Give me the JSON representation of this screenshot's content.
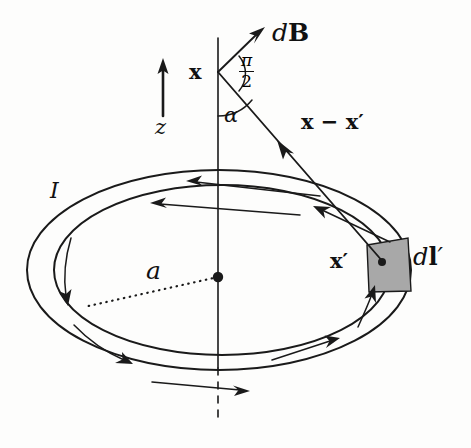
{
  "figure": {
    "background_color": "#fdfdfc",
    "ink_color": "#1a1a1a",
    "element_fill_color": "#a8a8a8"
  },
  "labels": {
    "field_element": "dB",
    "field_element_d": "d",
    "field_element_B": "B",
    "field_point": "x",
    "angle_alpha": "α",
    "angle_right_numerator": "π",
    "angle_right_denominator": "2",
    "separation_vector": "x − x′",
    "axis_label": "z",
    "current_label": "I",
    "radius_label": "a",
    "source_point": "x′",
    "current_element": "dl′",
    "current_element_d": "d",
    "current_element_l": "l",
    "current_element_prime": "′"
  },
  "geometry": {
    "vertex_field_point": {
      "x": 218,
      "y": 72
    },
    "loop_center": {
      "x": 218,
      "y": 277
    },
    "source_point_dot": {
      "x": 382,
      "y": 262
    },
    "axis_top_y": 38,
    "axis_bottom_y": 422,
    "outer_ellipse": {
      "cx": 219,
      "cy": 270,
      "rx": 192,
      "ry": 100
    },
    "inner_ellipse": {
      "cx": 222,
      "cy": 270,
      "rx": 168,
      "ry": 85
    },
    "z_arrow": {
      "x": 163,
      "y_tail": 116,
      "y_head": 60
    }
  },
  "annotations": {
    "right_angle_between": "dB is perpendicular to x − x′",
    "alpha_between": "z axis and x − x′",
    "current_direction": "counterclockwise viewed from above"
  }
}
